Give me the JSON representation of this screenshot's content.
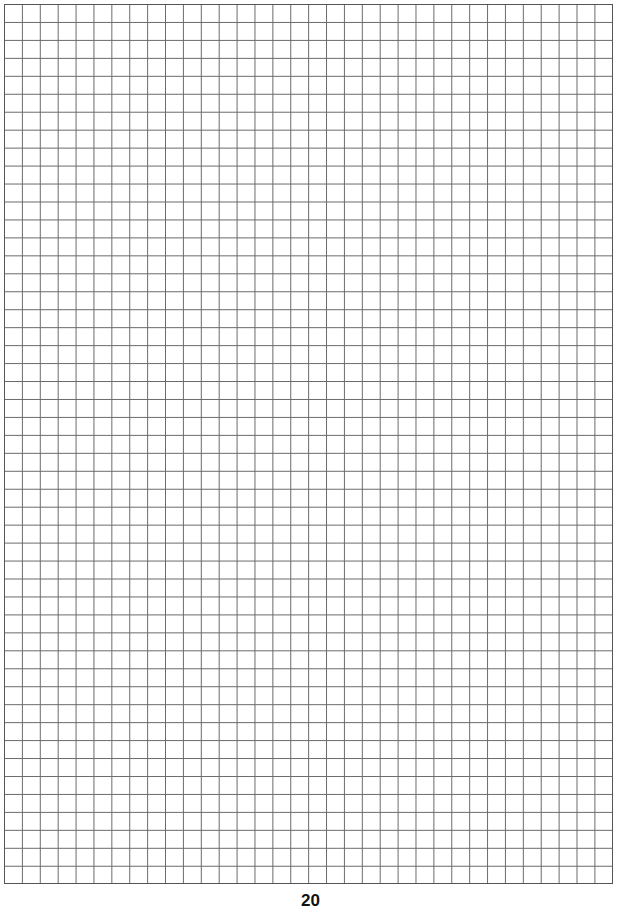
{
  "page": {
    "type": "grid-paper",
    "grid": {
      "columns": 34,
      "rows": 49,
      "line_color": "#6a6a6a",
      "border_color": "#555555"
    },
    "page_number": "20"
  }
}
